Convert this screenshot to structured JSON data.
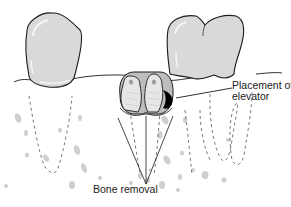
{
  "figure": {
    "labels": {
      "placement_line1": "Placement of",
      "placement_line2": "elevator",
      "bone_removal": "Bone removal"
    },
    "colors": {
      "outline": "#1a1a1a",
      "tooth_fill": "#d9d9d9",
      "tooth_highlight": "#f4f4f4",
      "bone_window": "#bdbdbd",
      "elevator": "#000000",
      "dashed_root": "#555555",
      "bone_speckle": "#cfcfcf"
    },
    "elements": [
      "left-molar-crown",
      "right-molar-crown",
      "gum-line",
      "impacted-tooth",
      "elevator-tip",
      "bone-removal-pointer-lines",
      "dashed-root-outlines",
      "bone-trabeculae-speckles"
    ]
  }
}
